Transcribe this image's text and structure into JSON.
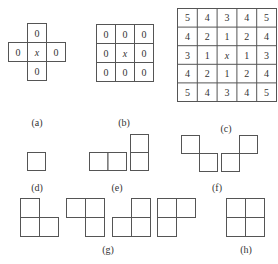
{
  "figure": {
    "panels": [
      {
        "id": "a",
        "label": "(a)",
        "description": "4-neighborhood (cross)",
        "cells": {
          "top": "0",
          "left": "0",
          "center": "x",
          "right": "0",
          "bottom": "0"
        }
      },
      {
        "id": "b",
        "label": "(b)",
        "description": "8-neighborhood 3x3",
        "grid": [
          [
            "0",
            "0",
            "0"
          ],
          [
            "0",
            "x",
            "0"
          ],
          [
            "0",
            "0",
            "0"
          ]
        ]
      },
      {
        "id": "c",
        "label": "(c)",
        "description": "5x5 distance-order neighborhood",
        "grid": [
          [
            "5",
            "4",
            "3",
            "4",
            "5"
          ],
          [
            "4",
            "2",
            "1",
            "2",
            "4"
          ],
          [
            "3",
            "1",
            "x",
            "1",
            "3"
          ],
          [
            "4",
            "2",
            "1",
            "2",
            "4"
          ],
          [
            "5",
            "4",
            "3",
            "4",
            "5"
          ]
        ]
      },
      {
        "id": "d",
        "label": "(d)",
        "description": "single square clique"
      },
      {
        "id": "e",
        "label": "(e)",
        "description": "horizontal and vertical pair cliques"
      },
      {
        "id": "f",
        "label": "(f)",
        "description": "diagonal pair cliques"
      },
      {
        "id": "g",
        "label": "(g)",
        "description": "four L-shaped triple cliques"
      },
      {
        "id": "h",
        "label": "(h)",
        "description": "2x2 quadruple clique"
      }
    ]
  },
  "colors": {
    "line": "#555555",
    "text": "#333333",
    "background": "#ffffff"
  }
}
